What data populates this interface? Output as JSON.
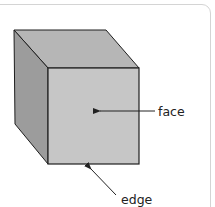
{
  "diagram": {
    "labels": {
      "face": "face",
      "edge": "edge"
    },
    "colors": {
      "top_face": "#b6b6b6",
      "side_face": "#9c9c9c",
      "front_face": "#c6c6c6",
      "outline": "#1e1e1e",
      "frame_border": "#d4d4d4",
      "arrow": "#222222"
    }
  }
}
